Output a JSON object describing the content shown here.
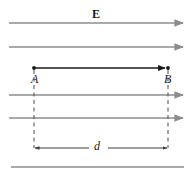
{
  "figure": {
    "type": "physics-diagram",
    "background_color": "#ffffff",
    "width": 195,
    "height": 176
  },
  "labels": {
    "field_label": "E",
    "point_a": "A",
    "point_b": "B",
    "distance": "d"
  },
  "colors": {
    "field_line": "#8c8c8c",
    "displacement_arrow": "#1a1a1a",
    "dimension_line": "#3d3d3d",
    "dashed_guide": "#4d4d4d",
    "text": "#1a1a1a"
  },
  "geometry": {
    "field_lines_y": [
      23,
      47,
      95,
      118,
      167
    ],
    "point_a_x": 34,
    "point_b_x": 168,
    "displacement_y": 68,
    "dimension_y": 148
  }
}
